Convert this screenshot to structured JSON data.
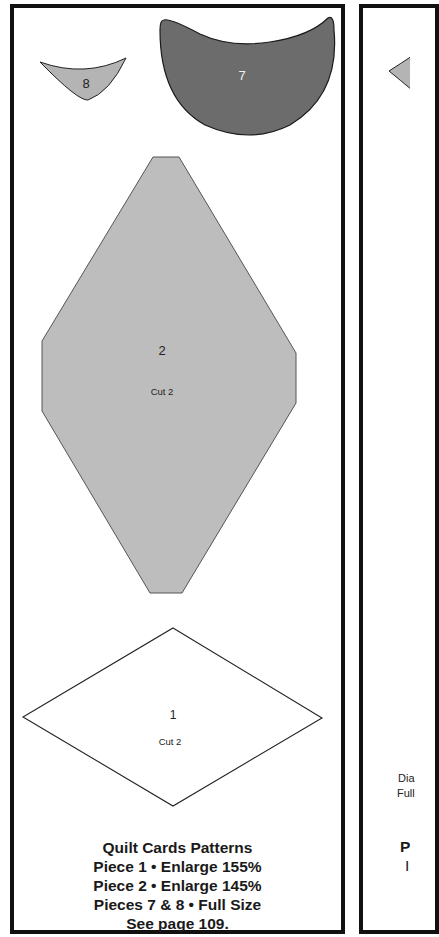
{
  "left_page": {
    "pieces": [
      {
        "id": "piece-8",
        "label": "8",
        "fill": "#b4b4b4"
      },
      {
        "id": "piece-7",
        "label": "7",
        "fill": "#6c6c6c"
      },
      {
        "id": "piece-2",
        "label": "2",
        "cut": "Cut 2",
        "fill": "#bdbdbd"
      },
      {
        "id": "piece-1",
        "label": "1",
        "cut": "Cut 2",
        "fill": "#ffffff"
      }
    ],
    "caption": {
      "title": "Quilt Cards Patterns",
      "line1": "Piece 1 • Enlarge 155%",
      "line2": "Piece 2 • Enlarge 145%",
      "line3": "Pieces 7 & 8 • Full Size",
      "line4": "See page 109."
    }
  },
  "right_page": {
    "text_line1": "Dia",
    "text_line2": "Full",
    "caption_partial1": "P",
    "caption_partial2": "I"
  }
}
